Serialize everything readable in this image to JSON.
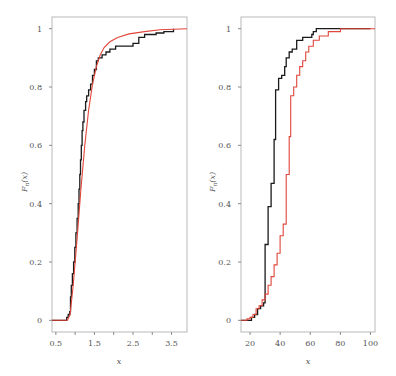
{
  "chart_data": [
    {
      "type": "line",
      "title": "",
      "xlabel": "x",
      "ylabel": "F_n(x)",
      "xlim": [
        0.4,
        3.9
      ],
      "ylim": [
        -0.04,
        1.04
      ],
      "xticks": [
        "0.5",
        "1.5",
        "2.5",
        "3.5"
      ],
      "xticks_minor": [
        1.0,
        2.0,
        3.0
      ],
      "yticks": [
        "0",
        "0.2",
        "0.4",
        "0.6",
        "0.8",
        "1"
      ],
      "grid": false,
      "legend": null,
      "series": [
        {
          "name": "empirical CDF",
          "color": "#1a1a1a",
          "style": "step",
          "points": [
            [
              0.4,
              0
            ],
            [
              0.75,
              0
            ],
            [
              0.78,
              0.01
            ],
            [
              0.82,
              0.02
            ],
            [
              0.86,
              0.03
            ],
            [
              0.88,
              0.08
            ],
            [
              0.9,
              0.12
            ],
            [
              0.93,
              0.16
            ],
            [
              0.96,
              0.2
            ],
            [
              0.99,
              0.25
            ],
            [
              1.02,
              0.3
            ],
            [
              1.05,
              0.35
            ],
            [
              1.08,
              0.4
            ],
            [
              1.1,
              0.45
            ],
            [
              1.12,
              0.5
            ],
            [
              1.14,
              0.55
            ],
            [
              1.16,
              0.6
            ],
            [
              1.18,
              0.65
            ],
            [
              1.2,
              0.68
            ],
            [
              1.23,
              0.72
            ],
            [
              1.27,
              0.75
            ],
            [
              1.3,
              0.77
            ],
            [
              1.35,
              0.79
            ],
            [
              1.4,
              0.81
            ],
            [
              1.45,
              0.84
            ],
            [
              1.5,
              0.86
            ],
            [
              1.55,
              0.89
            ],
            [
              1.6,
              0.9
            ],
            [
              1.7,
              0.91
            ],
            [
              1.8,
              0.92
            ],
            [
              1.9,
              0.93
            ],
            [
              2.05,
              0.94
            ],
            [
              2.3,
              0.94
            ],
            [
              2.5,
              0.95
            ],
            [
              2.65,
              0.97
            ],
            [
              2.8,
              0.98
            ],
            [
              3.1,
              0.985
            ],
            [
              3.3,
              0.99
            ],
            [
              3.55,
              1.0
            ]
          ]
        },
        {
          "name": "fitted CDF",
          "color": "#e0463a",
          "style": "line",
          "points": [
            [
              0.4,
              0
            ],
            [
              0.8,
              0
            ],
            [
              0.87,
              0.02
            ],
            [
              0.95,
              0.12
            ],
            [
              1.05,
              0.28
            ],
            [
              1.15,
              0.45
            ],
            [
              1.25,
              0.6
            ],
            [
              1.35,
              0.72
            ],
            [
              1.45,
              0.81
            ],
            [
              1.55,
              0.87
            ],
            [
              1.65,
              0.91
            ],
            [
              1.75,
              0.935
            ],
            [
              1.9,
              0.955
            ],
            [
              2.1,
              0.97
            ],
            [
              2.4,
              0.982
            ],
            [
              2.8,
              0.99
            ],
            [
              3.2,
              0.996
            ],
            [
              3.9,
              1.0
            ]
          ]
        }
      ]
    },
    {
      "type": "line",
      "title": "",
      "xlabel": "x",
      "ylabel": "F_n(x)",
      "xlim": [
        14,
        103
      ],
      "ylim": [
        -0.04,
        1.04
      ],
      "xticks": [
        "20",
        "40",
        "60",
        "80",
        "100"
      ],
      "yticks": [
        "0",
        "0.2",
        "0.4",
        "0.6",
        "0.8",
        "1"
      ],
      "grid": false,
      "legend": null,
      "series": [
        {
          "name": "empirical CDF",
          "color": "#1a1a1a",
          "style": "step",
          "points": [
            [
              14,
              0
            ],
            [
              20,
              0
            ],
            [
              21,
              0.01
            ],
            [
              23,
              0.02
            ],
            [
              25,
              0.04
            ],
            [
              27,
              0.05
            ],
            [
              29,
              0.06
            ],
            [
              30,
              0.26
            ],
            [
              32,
              0.39
            ],
            [
              34,
              0.47
            ],
            [
              36,
              0.62
            ],
            [
              37,
              0.79
            ],
            [
              39,
              0.83
            ],
            [
              41,
              0.84
            ],
            [
              43,
              0.87
            ],
            [
              44,
              0.9
            ],
            [
              46,
              0.92
            ],
            [
              48,
              0.93
            ],
            [
              51,
              0.96
            ],
            [
              55,
              0.97
            ],
            [
              61,
              0.98
            ],
            [
              62,
              0.99
            ],
            [
              64,
              1.0
            ],
            [
              100,
              1.0
            ]
          ]
        },
        {
          "name": "comparison CDF",
          "color": "#e0463a",
          "style": "step",
          "points": [
            [
              14,
              0
            ],
            [
              18,
              0.005
            ],
            [
              20,
              0.01
            ],
            [
              22,
              0.02
            ],
            [
              24,
              0.04
            ],
            [
              26,
              0.05
            ],
            [
              28,
              0.07
            ],
            [
              30,
              0.09
            ],
            [
              32,
              0.12
            ],
            [
              34,
              0.15
            ],
            [
              36,
              0.19
            ],
            [
              38,
              0.23
            ],
            [
              40,
              0.29
            ],
            [
              42,
              0.33
            ],
            [
              44,
              0.5
            ],
            [
              46,
              0.63
            ],
            [
              47,
              0.77
            ],
            [
              49,
              0.8
            ],
            [
              51,
              0.84
            ],
            [
              53,
              0.87
            ],
            [
              55,
              0.89
            ],
            [
              57,
              0.92
            ],
            [
              59,
              0.94
            ],
            [
              62,
              0.96
            ],
            [
              66,
              0.975
            ],
            [
              72,
              0.99
            ],
            [
              80,
              1.0
            ],
            [
              103,
              1.0
            ]
          ]
        }
      ]
    }
  ],
  "panels": [
    {
      "ylabel_main": "F",
      "ylabel_sub": "n",
      "ylabel_arg": "(x)",
      "xlabel": "x"
    },
    {
      "ylabel_main": "F",
      "ylabel_sub": "n",
      "ylabel_arg": "(x)",
      "xlabel": "x"
    }
  ]
}
